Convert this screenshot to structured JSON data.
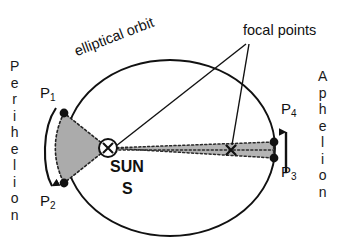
{
  "diagram": {
    "title_alt": "Kepler second law elliptical orbit diagram",
    "labels": {
      "elliptical_orbit": "elliptical orbit",
      "focal_points": "focal points",
      "sun": "SUN",
      "sun_symbol": "S",
      "perihelion": "Perihelion",
      "aphelion": "Aphelion",
      "p1": "P",
      "p1_sub": "1",
      "p2": "P",
      "p2_sub": "2",
      "p3": "P",
      "p3_sub": "3",
      "p4": "P",
      "p4_sub": "4"
    },
    "colors": {
      "stroke": "#111111",
      "sector_fill": "#ababab",
      "background": "#ffffff",
      "dotted": "#333333"
    },
    "geometry": {
      "ellipse_center_x": 170,
      "ellipse_center_y": 148,
      "ellipse_rx": 105,
      "ellipse_ry": 88,
      "focus_sun_x": 108,
      "focus_sun_y": 148,
      "focus_second_x": 231,
      "focus_second_y": 150,
      "sun_radius": 9,
      "p1_x": 64,
      "p1_y": 113,
      "p2_x": 64,
      "p2_y": 183,
      "p3_x": 274,
      "p3_y": 158,
      "p4_x": 274,
      "p4_y": 142
    },
    "icons": {
      "sun_marker": "cross-in-circle-icon",
      "focus_marker": "cross-icon",
      "arrow_perihelion": "arrow-down-icon",
      "arrow_aphelion": "arrow-up-icon"
    }
  }
}
